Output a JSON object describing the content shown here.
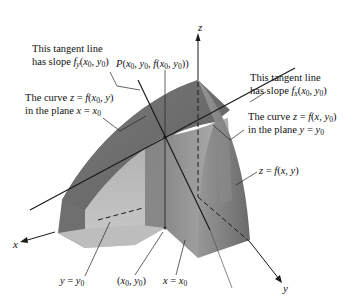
{
  "figure": {
    "axes": {
      "x_label": "x",
      "y_label": "y",
      "z_label": "z"
    },
    "annotations": {
      "tangent_fy_line1": "This tangent line",
      "tangent_fy_line2": "has slope f_y(x_0, y_0)",
      "point_P": "P(x_0, y_0, f(x_0, y_0))",
      "curve_x0_line1": "The curve z = f(x_0, y)",
      "curve_x0_line2": "in the plane x = x_0",
      "tangent_fx_line1": "This tangent line",
      "tangent_fx_line2": "has slope f_x(x_0, y_0)",
      "curve_y0_line1": "The curve z = f(x, y_0)",
      "curve_y0_line2": "in the plane y = y_0",
      "surface": "z = f(x, y)",
      "plane_y0": "y = y_0",
      "base_point": "(x_0, y_0)",
      "plane_x0": "x = x_0"
    },
    "colors": {
      "surface_dark": "#6e6e6e",
      "surface_mid": "#8f8f8f",
      "surface_light": "#b4b4b4",
      "base_light": "#c8c8c8",
      "line": "#1a1a1a",
      "leader": "#333333"
    }
  }
}
